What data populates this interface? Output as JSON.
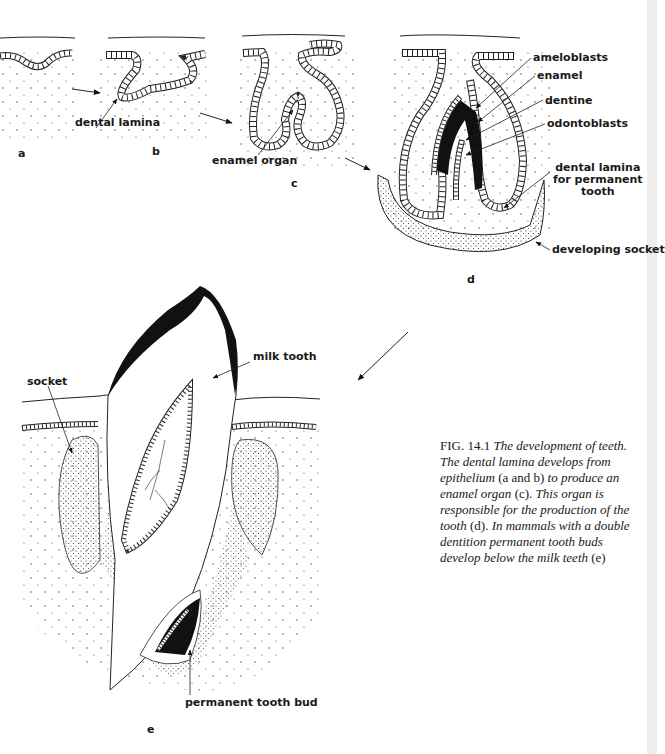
{
  "figure": {
    "panels": [
      {
        "id": "a",
        "label": "a"
      },
      {
        "id": "b",
        "label": "b"
      },
      {
        "id": "c",
        "label": "c"
      },
      {
        "id": "d",
        "label": "d"
      },
      {
        "id": "e",
        "label": "e"
      }
    ],
    "labels": {
      "dental_lamina": "dental lamina",
      "enamel_organ": "enamel organ",
      "ameloblasts": "ameloblasts",
      "enamel": "enamel",
      "dentine": "dentine",
      "odontoblasts": "odontoblasts",
      "dental_lamina_permanent": "dental lamina\nfor permanent\ntooth",
      "developing_socket": "developing socket",
      "milk_tooth": "milk tooth",
      "socket": "socket",
      "permanent_tooth_bud": "permanent tooth bud"
    },
    "caption": {
      "fig_prefix": "FIG.",
      "fig_number": "14.1",
      "parts": [
        {
          "text": " The development of teeth. The dental lamina develops from epithelium",
          "italic": true
        },
        {
          "text": " (a and b) ",
          "italic": false
        },
        {
          "text": "to produce an enamel organ",
          "italic": true
        },
        {
          "text": " (c). ",
          "italic": false
        },
        {
          "text": "This organ is responsible for the production of the tooth",
          "italic": true
        },
        {
          "text": " (d). ",
          "italic": false
        },
        {
          "text": "In mammals with a double dentition permanent tooth buds develop below the milk teeth",
          "italic": true
        },
        {
          "text": " (e)",
          "italic": false
        }
      ]
    }
  }
}
